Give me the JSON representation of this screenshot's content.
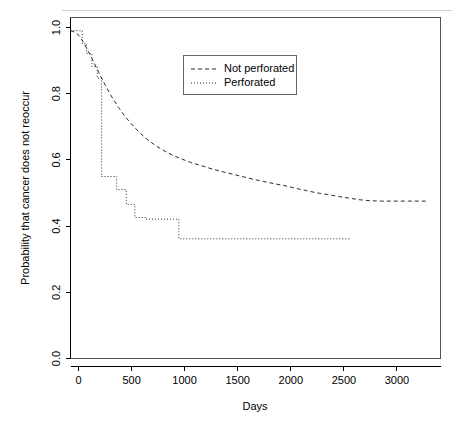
{
  "chart_data": {
    "type": "line",
    "title": "",
    "xlabel": "Days",
    "ylabel": "Probability that cancer does not reoccur",
    "xlim": [
      0,
      3450
    ],
    "ylim": [
      0.0,
      1.04
    ],
    "xticks": [
      0,
      500,
      1000,
      1500,
      2000,
      2500,
      3000
    ],
    "xticklabels": [
      "0",
      "500",
      "1000",
      "1500",
      "2000",
      "2500",
      "3000"
    ],
    "yticks": [
      0.0,
      0.2,
      0.4,
      0.6,
      0.8,
      1.0
    ],
    "yticklabels": [
      "0.0",
      "0.2",
      "0.4",
      "0.6",
      "0.8",
      "1.0"
    ],
    "grid": false,
    "legend_position": "upper center",
    "series": [
      {
        "name": "Not perforated",
        "linestyle": "dashed",
        "color": "#2b2b2b",
        "points": [
          [
            0,
            1.0
          ],
          [
            40,
            0.995
          ],
          [
            80,
            0.985
          ],
          [
            120,
            0.965
          ],
          [
            160,
            0.94
          ],
          [
            200,
            0.915
          ],
          [
            240,
            0.888
          ],
          [
            280,
            0.862
          ],
          [
            320,
            0.836
          ],
          [
            360,
            0.812
          ],
          [
            400,
            0.79
          ],
          [
            450,
            0.765
          ],
          [
            500,
            0.742
          ],
          [
            560,
            0.718
          ],
          [
            620,
            0.697
          ],
          [
            680,
            0.678
          ],
          [
            740,
            0.662
          ],
          [
            800,
            0.648
          ],
          [
            880,
            0.632
          ],
          [
            960,
            0.619
          ],
          [
            1040,
            0.608
          ],
          [
            1120,
            0.598
          ],
          [
            1200,
            0.59
          ],
          [
            1300,
            0.58
          ],
          [
            1400,
            0.571
          ],
          [
            1500,
            0.563
          ],
          [
            1600,
            0.555
          ],
          [
            1700,
            0.547
          ],
          [
            1800,
            0.54
          ],
          [
            1900,
            0.533
          ],
          [
            2000,
            0.527
          ],
          [
            2100,
            0.519
          ],
          [
            2200,
            0.512
          ],
          [
            2300,
            0.505
          ],
          [
            2400,
            0.5
          ],
          [
            2500,
            0.494
          ],
          [
            2600,
            0.489
          ],
          [
            2700,
            0.484
          ],
          [
            2800,
            0.481
          ],
          [
            2900,
            0.48
          ],
          [
            3000,
            0.48
          ],
          [
            3150,
            0.48
          ],
          [
            3330,
            0.48
          ]
        ],
        "end_x": 3330,
        "end_y": 0.48
      },
      {
        "name": "Perforated",
        "linestyle": "dotted",
        "color": "#2b2b2b",
        "points": [
          [
            0,
            1.0
          ],
          [
            110,
            1.0
          ],
          [
            110,
            0.96
          ],
          [
            150,
            0.96
          ],
          [
            150,
            0.93
          ],
          [
            200,
            0.93
          ],
          [
            200,
            0.89
          ],
          [
            250,
            0.89
          ],
          [
            250,
            0.855
          ],
          [
            290,
            0.855
          ],
          [
            290,
            0.555
          ],
          [
            430,
            0.555
          ],
          [
            430,
            0.515
          ],
          [
            520,
            0.515
          ],
          [
            520,
            0.47
          ],
          [
            600,
            0.47
          ],
          [
            600,
            0.43
          ],
          [
            700,
            0.43
          ],
          [
            700,
            0.425
          ],
          [
            1010,
            0.425
          ],
          [
            1010,
            0.365
          ],
          [
            1600,
            0.365
          ],
          [
            2100,
            0.365
          ],
          [
            2600,
            0.365
          ]
        ],
        "end_x": 2600,
        "end_y": 0.365
      }
    ],
    "legend_entries": [
      {
        "label": "Not perforated",
        "linestyle": "dashed"
      },
      {
        "label": "Perforated",
        "linestyle": "dotted"
      }
    ]
  },
  "axes": {
    "x_title": "Days",
    "y_title": "Probability that cancer does not reoccur",
    "x_tick_labels": [
      "0",
      "500",
      "1000",
      "1500",
      "2000",
      "2500",
      "3000"
    ],
    "y_tick_labels": [
      "0.0",
      "0.2",
      "0.4",
      "0.6",
      "0.8",
      "1.0"
    ]
  },
  "legend": {
    "items": [
      {
        "label": "Not perforated"
      },
      {
        "label": "Perforated"
      }
    ]
  },
  "colors": {
    "line": "#2b2b2b",
    "frame": "#555555",
    "background": "#ffffff"
  }
}
